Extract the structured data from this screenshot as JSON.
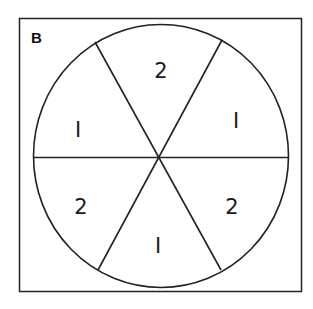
{
  "figure": {
    "label": "B",
    "shape": "spinner",
    "sections": [
      {
        "position": "top",
        "value": "2"
      },
      {
        "position": "upper-right",
        "value": "1"
      },
      {
        "position": "lower-right",
        "value": "2"
      },
      {
        "position": "bottom",
        "value": "1"
      },
      {
        "position": "lower-left",
        "value": "2"
      },
      {
        "position": "upper-left",
        "value": "1"
      }
    ],
    "display_glyphs": {
      "one": "I",
      "two": "2"
    },
    "colors": {
      "stroke": "#222222",
      "background": "#ffffff"
    }
  }
}
